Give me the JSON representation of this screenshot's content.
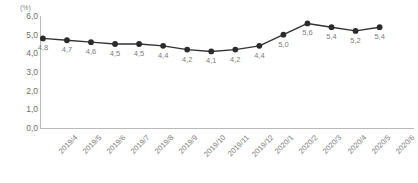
{
  "chart_data": {
    "type": "line",
    "title": "",
    "xlabel": "",
    "ylabel": "",
    "unit_label": "(%)",
    "categories": [
      "2019/4",
      "2019/5",
      "2019/6",
      "2019/7",
      "2019/8",
      "2019/9",
      "2019/10",
      "2019/11",
      "2019/12",
      "2020/1",
      "2020/2",
      "2020/3",
      "2020/4",
      "2020/5",
      "2020/6"
    ],
    "values": [
      4.8,
      4.7,
      4.6,
      4.5,
      4.5,
      4.4,
      4.2,
      4.1,
      4.2,
      4.4,
      5.0,
      5.6,
      5.4,
      5.2,
      5.4
    ],
    "point_labels": [
      "4,8",
      "4,7",
      "4,6",
      "4,5",
      "4,5",
      "4,4",
      "4,2",
      "4,1",
      "4,2",
      "4,4",
      "5,0",
      "5,6",
      "5,4",
      "5,2",
      "5,4"
    ],
    "ylim": [
      0.0,
      6.0
    ],
    "ytick_values": [
      6.0,
      5.0,
      4.0,
      3.0,
      2.0,
      1.0,
      0.0
    ],
    "ytick_labels": [
      "6,0",
      "5,0",
      "4,0",
      "3,0",
      "2,0",
      "1,0",
      "0,0"
    ],
    "grid": false,
    "legend": false,
    "legend_position": "none",
    "decimal_separator": ",",
    "series_color": "#333333",
    "marker_color": "#2b2b2b",
    "axis_color": "#b9b9b9",
    "label_color": "#7c7c7c"
  }
}
